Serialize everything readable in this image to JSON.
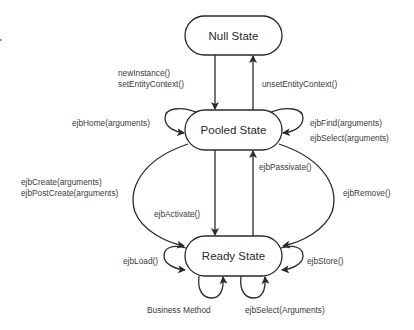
{
  "diagram": {
    "states": {
      "null_state": "Null State",
      "pooled_state": "Pooled State",
      "ready_state": "Ready State"
    },
    "transitions": {
      "null_to_pooled": [
        "newInstance()",
        "setEntityContext()"
      ],
      "pooled_to_null": "unsetEntityContext()",
      "pooled_self_left": "ejbHome(arguments)",
      "pooled_self_right": [
        "ejbFind(arguments)",
        "ejbSelect(arguments)"
      ],
      "pooled_to_ready_create": [
        "ejbCreate(arguments)",
        "ejbPostCreate(arguments)"
      ],
      "pooled_to_ready_activate": "ejbActivate()",
      "ready_to_pooled_passivate": "ejbPassivate()",
      "ready_to_pooled_remove": "ejbRemove()",
      "ready_self_left": "ejbLoad()",
      "ready_self_right": "ejbStore()",
      "ready_self_bottom_left": "Business Method",
      "ready_self_bottom_right": "ejbSelect(Arguments)"
    }
  }
}
